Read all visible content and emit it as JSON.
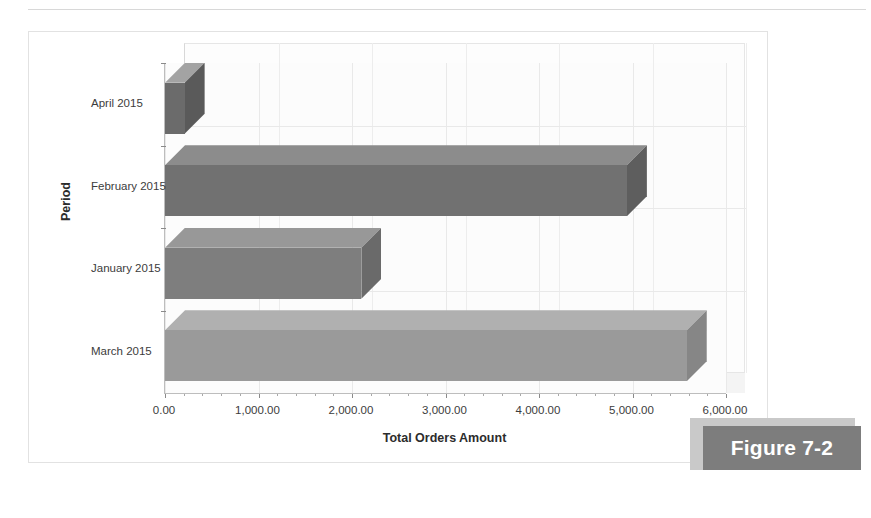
{
  "figure": {
    "caption": "Figure 7-2"
  },
  "chart_data": {
    "type": "bar",
    "orientation": "horizontal",
    "style": "3d",
    "title": "",
    "xlabel": "Total Orders Amount",
    "ylabel": "Period",
    "categories": [
      "April 2015",
      "February 2015",
      "January 2015",
      "March 2015"
    ],
    "values": [
      210,
      4940,
      2100,
      5580
    ],
    "series": [
      {
        "name": "Total Orders Amount",
        "values": [
          210,
          4940,
          2100,
          5580
        ]
      }
    ],
    "xlim": [
      0,
      6000
    ],
    "xticks": [
      0,
      1000,
      2000,
      3000,
      4000,
      5000,
      6000
    ],
    "xtick_labels": [
      "0.00",
      "1,000.00",
      "2,000.00",
      "3,000.00",
      "4,000.00",
      "5,000.00",
      "6,000.00"
    ],
    "grid": true,
    "legend": false,
    "bar_colors": [
      "#6b6b6b",
      "#717171",
      "#7e7e7e",
      "#9a9a9a"
    ],
    "bar_top_colors": [
      "#a3a3a3",
      "#8c8c8c",
      "#989898",
      "#b0b0b0"
    ],
    "bar_side_colors": [
      "#5a5a5a",
      "#5e5e5e",
      "#6a6a6a",
      "#868686"
    ],
    "plot_background": "#fcfcfc",
    "gridline_color": "#e9e9e9",
    "axis_color": "#bdbdbd"
  }
}
